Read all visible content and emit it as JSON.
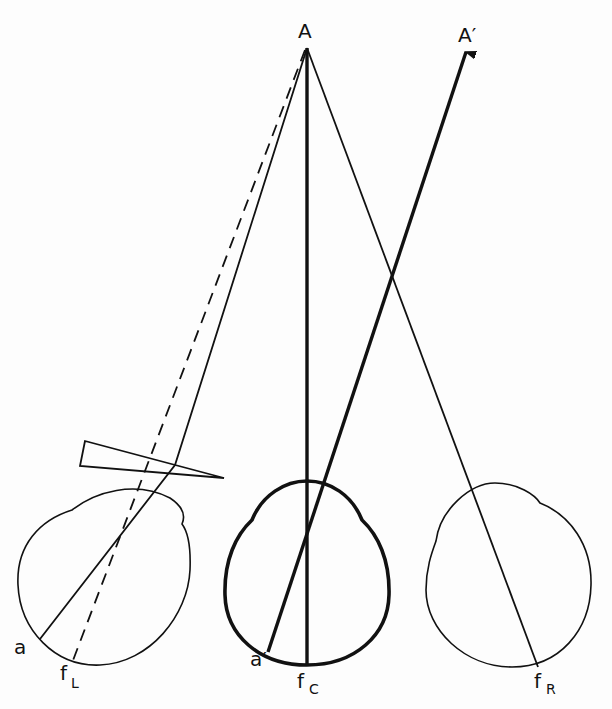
{
  "diagram": {
    "type": "optics / binocular vision schematic",
    "labels": {
      "object_point": "A",
      "apparent_point": "A′",
      "left_image_point": "a",
      "cyclopean_image_point": "a′",
      "left_fovea": "f",
      "left_fovea_sub": "L",
      "cyclopean_fovea": "f",
      "cyclopean_fovea_sub": "C",
      "right_fovea": "f",
      "right_fovea_sub": "R"
    },
    "elements": [
      {
        "name": "left-eye",
        "stroke": "thin"
      },
      {
        "name": "cyclopean-eye",
        "stroke": "bold"
      },
      {
        "name": "right-eye",
        "stroke": "thin"
      },
      {
        "name": "prism",
        "shape": "thin wedge in front of left eye"
      },
      {
        "name": "ray-A-to-a",
        "style": "solid, refracted by prism"
      },
      {
        "name": "ray-A-to-fL",
        "style": "dashed"
      },
      {
        "name": "ray-A-to-fC",
        "style": "bold vertical"
      },
      {
        "name": "ray-A-to-fR",
        "style": "solid"
      },
      {
        "name": "ray-a-prime-to-A-prime",
        "style": "bold arrow"
      }
    ],
    "colors": {
      "ink": "#111111",
      "paper": "#fdfdfd"
    }
  }
}
